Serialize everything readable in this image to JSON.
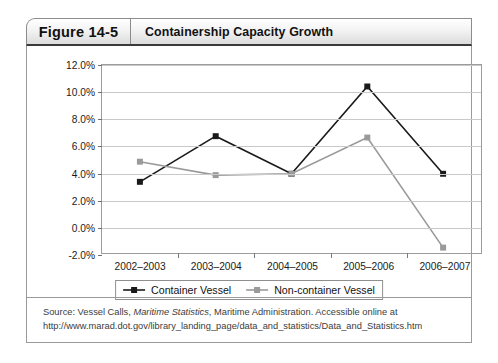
{
  "header": {
    "figure_number": "Figure 14-5",
    "caption": "Containership Capacity Growth"
  },
  "legend": {
    "position": "bottom-center",
    "items": [
      {
        "label": "Container Vessel",
        "color": "#1a1a1a"
      },
      {
        "label": "Non-container Vessel",
        "color": "#9a9a9a"
      }
    ]
  },
  "source": {
    "prefix": "Source: Vessel Calls, ",
    "italic": "Maritime Statistics",
    "suffix": ", Maritime Administration. Accessible online at http://www.marad.dot.gov/library_landing_page/data_and_statistics/Data_and_Statistics.htm"
  },
  "colors": {
    "container_vessel": "#1a1a1a",
    "non_container_vessel": "#9a9a9a",
    "gridline": "#c9c9c9",
    "plot_border": "#9c9c9c",
    "header_rule": "#3a3a3a"
  },
  "chart_data": {
    "type": "line",
    "title": "Containership Capacity Growth",
    "xlabel": "",
    "ylabel": "",
    "categories": [
      "2002–2003",
      "2003–2004",
      "2004–2005",
      "2005–2006",
      "2006–2007"
    ],
    "ylim": [
      -2.0,
      12.0
    ],
    "ytick_step": 2.0,
    "ytick_labels": [
      "-2.0%",
      "0.0%",
      "2.0%",
      "4.0%",
      "6.0%",
      "8.0%",
      "10.0%",
      "12.0%"
    ],
    "ytick_values": [
      -2.0,
      0.0,
      2.0,
      4.0,
      6.0,
      8.0,
      10.0,
      12.0
    ],
    "yunit": "%",
    "grid": true,
    "markers": "square",
    "series": [
      {
        "name": "Container Vessel",
        "color": "#1a1a1a",
        "values": [
          3.3,
          6.7,
          3.9,
          10.4,
          3.9
        ]
      },
      {
        "name": "Non-container Vessel",
        "color": "#9a9a9a",
        "values": [
          4.8,
          3.8,
          3.9,
          6.6,
          -1.6
        ]
      }
    ]
  }
}
